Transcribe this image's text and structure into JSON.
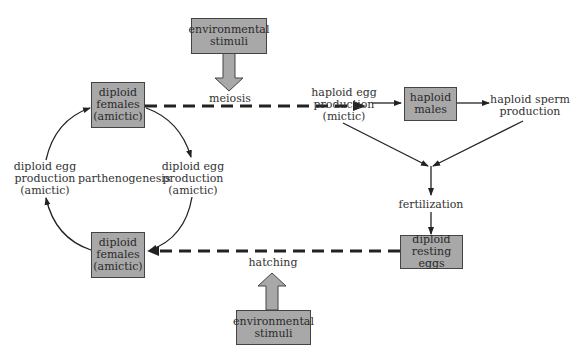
{
  "diagram": {
    "boxes": {
      "env_top": "environmental\nstimuli",
      "diploid_top": "diploid\nfemales\n(amictic)",
      "haploid_males": "haploid\nmales",
      "diploid_bottom": "diploid\nfemales\n(amictic)",
      "resting_eggs": "diploid\nresting eggs",
      "env_bottom": "environmental\nstimuli"
    },
    "labels": {
      "meiosis": "meiosis",
      "haploid_egg": "haploid egg\nproduction\n(mictic)",
      "haploid_sperm": "haploid sperm\nproduction",
      "fertilization": "fertilization",
      "hatching": "hatching",
      "diploid_egg_left": "diploid egg\nproduction\n(amictic)",
      "diploid_egg_right": "diploid egg\nproduction\n(amictic)",
      "parthenogenesis": "parthenogenesis"
    },
    "colors": {
      "box_fill": "#a8a8a8",
      "line": "#222222"
    }
  }
}
